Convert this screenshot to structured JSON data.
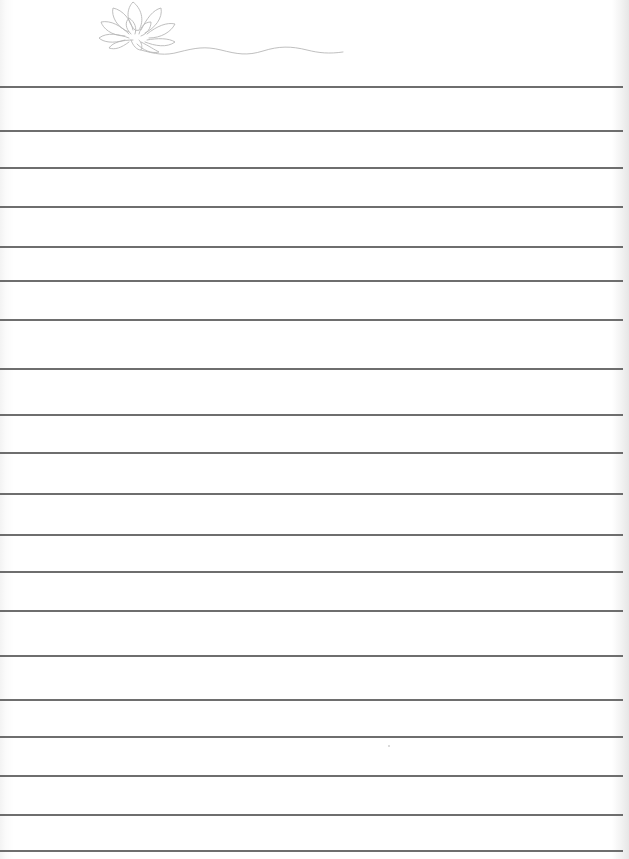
{
  "document": {
    "type": "lined-notepaper",
    "header_decoration": "lotus-flower-line-art",
    "line_color": "#555555",
    "art_color": "#b8b8b8",
    "background": "#ffffff",
    "ruled_lines_y": [
      87,
      131,
      168,
      207,
      247,
      281,
      320,
      369,
      415,
      453,
      494,
      535,
      572,
      611,
      656,
      700,
      737,
      776,
      815,
      851
    ]
  }
}
